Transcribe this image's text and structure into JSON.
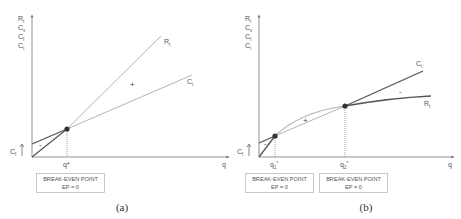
{
  "colors": {
    "axis": "#777777",
    "dark_line": "#555555",
    "light_line": "#b5b5b5",
    "point": "#333333",
    "box_border": "#bbbbbb",
    "text": "#555555"
  },
  "panel_a": {
    "caption": "(a)",
    "y_axis_labels": [
      {
        "main": "R",
        "sub": "t"
      },
      {
        "main": "C",
        "sub": "v"
      },
      {
        "main": "C",
        "sub": "f"
      },
      {
        "main": "C",
        "sub": "t"
      }
    ],
    "x_axis_label": "q",
    "fixed_cost_label": {
      "main": "C",
      "sub": "f"
    },
    "curve_labels": {
      "revenue": {
        "main": "R",
        "sub": "t"
      },
      "cost": {
        "main": "C",
        "sub": "t"
      }
    },
    "break_even_q_label": "q*",
    "profit_sign": "+",
    "loss_sign": "-",
    "break_even_box": {
      "line1": "BREAK-EVEN POINT",
      "line2": "EP = 0"
    }
  },
  "panel_b": {
    "caption": "(b)",
    "y_axis_labels": [
      {
        "main": "R",
        "sub": "t"
      },
      {
        "main": "C",
        "sub": "v"
      },
      {
        "main": "C",
        "sub": "f"
      },
      {
        "main": "C",
        "sub": "t"
      }
    ],
    "x_axis_label": "q",
    "fixed_cost_label": {
      "main": "C",
      "sub": "f"
    },
    "curve_labels": {
      "revenue": {
        "main": "R",
        "sub": "t"
      },
      "cost": {
        "main": "C",
        "sub": "t"
      }
    },
    "break_even_q1_label": {
      "main": "q",
      "sub": "1",
      "sup": "*"
    },
    "break_even_q2_label": {
      "main": "q",
      "sub": "2",
      "sup": "*"
    },
    "profit_sign": "+",
    "loss_sign_left": "-",
    "loss_sign_right": "-",
    "break_even_box_1": {
      "line1": "BREAK-EVEN POINT",
      "line2": "EP = 0"
    },
    "break_even_box_2": {
      "line1": "BREAK-EVEN POINT",
      "line2": "EP = 0"
    }
  }
}
